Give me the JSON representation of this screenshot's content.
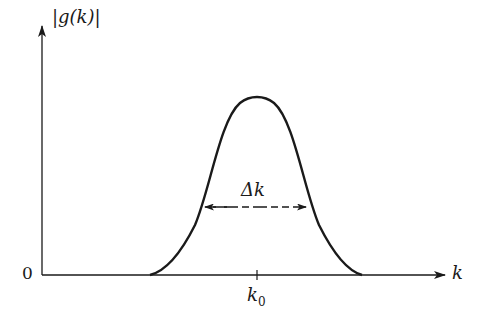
{
  "figure": {
    "y_axis_label": "|g(k)|",
    "x_axis_label": "k",
    "origin_label": "0",
    "center_tick_label_main": "k",
    "center_tick_label_sub": "0",
    "width_label": "Δk",
    "curve_shape": "gaussian",
    "colors": {
      "line": "#1a1a1a",
      "background": "#ffffff"
    }
  }
}
